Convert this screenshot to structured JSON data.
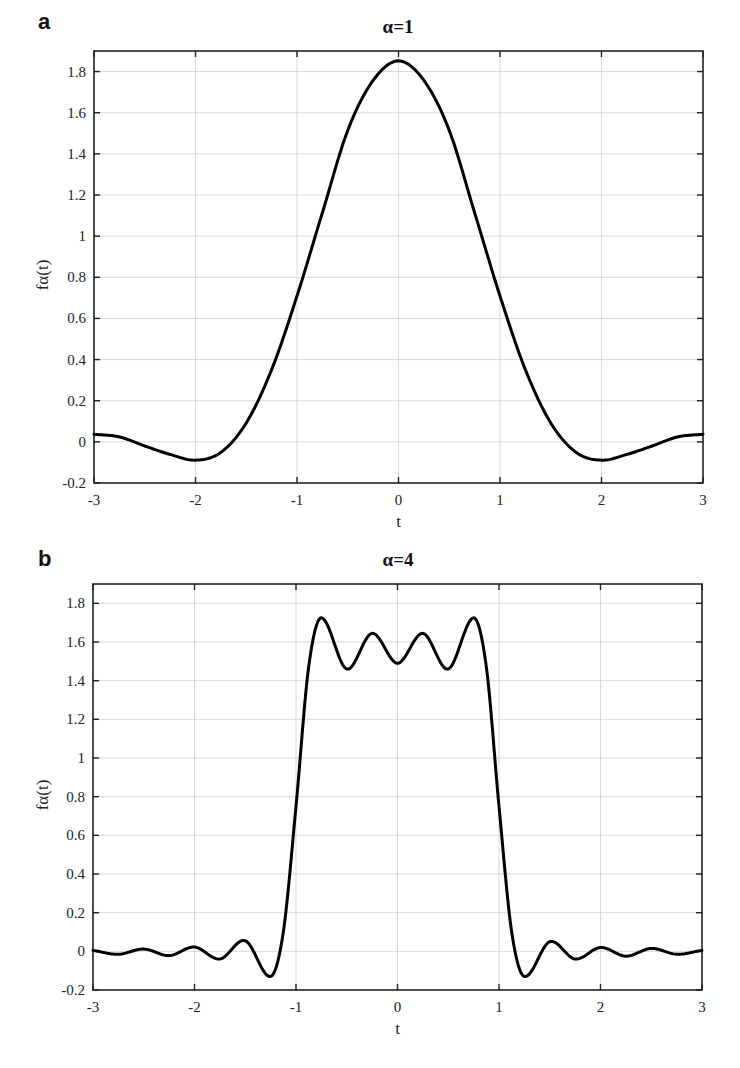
{
  "chart_data": [
    {
      "type": "line",
      "panel": "a",
      "title": "α=1",
      "xlabel": "t",
      "ylabel": "fα(t)",
      "xlim": [
        -3,
        3
      ],
      "ylim": [
        -0.2,
        1.9
      ],
      "xticks": [
        -3,
        -2,
        -1,
        0,
        1,
        2,
        3
      ],
      "xtick_labels": [
        "-3",
        "-2",
        "-1",
        "0",
        "1",
        "2",
        "3"
      ],
      "yticks": [
        -0.2,
        0,
        0.2,
        0.4,
        0.6,
        0.8,
        1,
        1.2,
        1.4,
        1.6,
        1.8
      ],
      "ytick_labels": [
        "-0.2",
        "0",
        "0.2",
        "0.4",
        "0.6",
        "0.8",
        "1",
        "1.2",
        "1.4",
        "1.6",
        "1.8"
      ],
      "grid": true,
      "series": [
        {
          "name": "fα(t), α=1",
          "color": "#000000",
          "x": [
            -3,
            -2.75,
            -2.5,
            -2.25,
            -2,
            -1.75,
            -1.5,
            -1.25,
            -1,
            -0.75,
            -0.5,
            -0.25,
            0,
            0.25,
            0.5,
            0.75,
            1,
            1.25,
            1.5,
            1.75,
            2,
            2.25,
            2.5,
            2.75,
            3
          ],
          "y": [
            0.037,
            0.024,
            -0.02,
            -0.061,
            -0.089,
            -0.051,
            0.092,
            0.351,
            0.709,
            1.114,
            1.514,
            1.757,
            1.852,
            1.757,
            1.514,
            1.114,
            0.709,
            0.351,
            0.092,
            -0.051,
            -0.089,
            -0.061,
            -0.02,
            0.024,
            0.037
          ]
        }
      ]
    },
    {
      "type": "line",
      "panel": "b",
      "title": "α=4",
      "xlabel": "t",
      "ylabel": "fα(t)",
      "xlim": [
        -3,
        3
      ],
      "ylim": [
        -0.2,
        1.9
      ],
      "xticks": [
        -3,
        -2,
        -1,
        0,
        1,
        2,
        3
      ],
      "xtick_labels": [
        "-3",
        "-2",
        "-1",
        "0",
        "1",
        "2",
        "3"
      ],
      "yticks": [
        -0.2,
        0,
        0.2,
        0.4,
        0.6,
        0.8,
        1,
        1.2,
        1.4,
        1.6,
        1.8
      ],
      "ytick_labels": [
        "-0.2",
        "0",
        "0.2",
        "0.4",
        "0.6",
        "0.8",
        "1",
        "1.2",
        "1.4",
        "1.6",
        "1.8"
      ],
      "grid": true,
      "series": [
        {
          "name": "fα(t), α=4",
          "color": "#000000",
          "x": [
            -3,
            -2.75,
            -2.5,
            -2.25,
            -2,
            -1.75,
            -1.5,
            -1.25,
            -1.125,
            -1,
            -0.875,
            -0.75,
            -0.5,
            -0.25,
            0,
            0.25,
            0.5,
            0.75,
            0.875,
            1,
            1.125,
            1.25,
            1.5,
            1.75,
            2,
            2.25,
            2.5,
            2.75,
            3
          ],
          "y": [
            0.005,
            -0.015,
            0.012,
            -0.022,
            0.022,
            -0.04,
            0.055,
            -0.13,
            0.1,
            0.75,
            1.472,
            1.725,
            1.46,
            1.645,
            1.49,
            1.645,
            1.46,
            1.725,
            1.472,
            0.75,
            0.1,
            -0.13,
            0.05,
            -0.04,
            0.02,
            -0.025,
            0.015,
            -0.015,
            0.005
          ]
        }
      ]
    }
  ]
}
